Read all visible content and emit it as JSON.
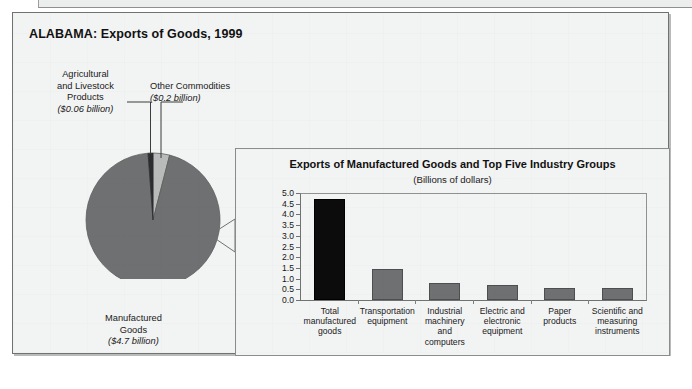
{
  "figure": {
    "title": "ALABAMA: Exports of Goods, 1999"
  },
  "pie_labels": {
    "agricultural": {
      "line1": "Agricultural",
      "line2": "and Livestock",
      "line3": "Products",
      "value": "($0.06 billion)"
    },
    "other": {
      "line1": "Other Commodities",
      "value": "($0.2 billion)"
    },
    "manufactured": {
      "line1": "Manufactured",
      "line2": "Goods",
      "value": "($4.7 billion)"
    }
  },
  "bar_panel": {
    "title": "Exports of Manufactured Goods and Top Five Industry Groups",
    "subtitle": "(Billions of dollars)"
  },
  "colors": {
    "manufactured_slice": "#6e7071",
    "other_slice": "#b9bbbb",
    "agricultural_slice": "#2b2d2e",
    "highlight_bar": "#0c0c0c",
    "bar": "#6e7071",
    "panel_background": "#f2f3f3"
  },
  "chart_data": [
    {
      "type": "pie",
      "title": "ALABAMA: Exports of Goods, 1999",
      "unit": "billions of dollars",
      "total": 4.96,
      "slices": [
        {
          "label": "Manufactured Goods",
          "value": 4.7,
          "value_label": "($4.7 billion)",
          "percent": 94.8,
          "color": "#6e7071"
        },
        {
          "label": "Other Commodities",
          "value": 0.2,
          "value_label": "($0.2 billion)",
          "percent": 4.0,
          "color": "#b9bbbb"
        },
        {
          "label": "Agricultural and Livestock Products",
          "value": 0.06,
          "value_label": "($0.06 billion)",
          "percent": 1.2,
          "color": "#2b2d2e"
        }
      ],
      "legend": "labels-with-leader-lines"
    },
    {
      "type": "bar",
      "title": "Exports of Manufactured Goods and Top Five Industry Groups",
      "subtitle": "(Billions of dollars)",
      "xlabel": "",
      "ylabel": "",
      "ylim": [
        0.0,
        5.0
      ],
      "ytick_step": 0.5,
      "yticks": [
        "5.0",
        "4.5",
        "4.0",
        "3.5",
        "3.0",
        "2.5",
        "2.0",
        "1.5",
        "1.0",
        "0.5",
        "0.0"
      ],
      "grid": false,
      "categories": [
        "Total manufactured goods",
        "Transportation equipment",
        "Industrial machinery and computers",
        "Electric and electronic equipment",
        "Paper products",
        "Scientific and measuring instruments"
      ],
      "category_lines": [
        [
          "Total",
          "manufactured",
          "goods"
        ],
        [
          "Transportation",
          "equipment"
        ],
        [
          "Industrial",
          "machinery and",
          "computers"
        ],
        [
          "Electric and",
          "electronic",
          "equipment"
        ],
        [
          "Paper",
          "products"
        ],
        [
          "Scientific and",
          "measuring",
          "instruments"
        ]
      ],
      "values": [
        4.7,
        1.45,
        0.78,
        0.7,
        0.55,
        0.55
      ],
      "highlight_index": 0
    }
  ]
}
